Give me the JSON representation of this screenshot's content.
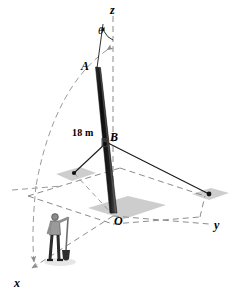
{
  "figure": {
    "colors": {
      "line": "#1a1a1a",
      "dashed": "#8c8c8c",
      "pole_dark": "#151515",
      "pole_light": "#4a4a4a",
      "shadow": "#c9c9c9",
      "ground_patch": "#bdbdbd",
      "person_coat": "#8f8f8f",
      "person_pants": "#2b2b2b",
      "background": "#ffffff"
    },
    "axes": [
      {
        "id": "z",
        "label": "z",
        "style": "dashed-vertical"
      },
      {
        "id": "y",
        "label": "y",
        "style": "dashed-right"
      },
      {
        "id": "x",
        "label": "x",
        "style": "dashed-lower-left"
      }
    ],
    "points": [
      {
        "id": "A",
        "label": "A",
        "description": "top end of pole"
      },
      {
        "id": "B",
        "label": "B",
        "description": "cable attachment point on pole"
      },
      {
        "id": "O",
        "label": "O",
        "description": "base of pole at origin"
      }
    ],
    "angle": {
      "label": "θ",
      "description": "angle between pole AO and the z-axis"
    },
    "dimensions": [
      {
        "id": "AB",
        "label": "18 m",
        "description": "length from A to B along the pole"
      }
    ],
    "elements": {
      "pole": "pole-AO",
      "swing_arc": "dashed-arc-with-arrowheads",
      "cable_left": "cable-B-to-left-anchor",
      "cable_right": "cable-B-to-right-anchor",
      "ground_plane": "dashed-parallelogram",
      "worker": "person-with-shovel"
    }
  }
}
